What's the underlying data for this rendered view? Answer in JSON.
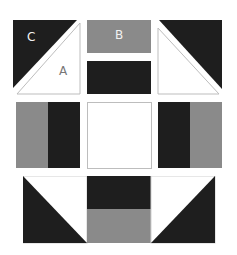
{
  "colors": {
    "dark": "#1e1e1e",
    "medium": "#8a8a8a",
    "light": "#ffffff",
    "outline": "#bdbdbd"
  },
  "labels": {
    "a": "A",
    "b": "B",
    "c": "C"
  },
  "rows": [
    {
      "name": "top-row",
      "pieces": [
        "half-square triangle C/A",
        "rectangle B + dark rectangle",
        "half-square triangle (mirrored)"
      ]
    },
    {
      "name": "middle-row",
      "pieces": [
        "medium/dark two-bar square",
        "light square",
        "dark/medium two-bar square"
      ]
    },
    {
      "name": "bottom-row",
      "pieces": [
        "dark lower-left triangle unit",
        "dark over medium rectangle unit",
        "dark lower-right triangle unit"
      ]
    }
  ]
}
